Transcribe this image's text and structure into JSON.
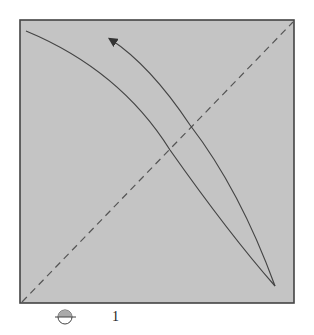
{
  "diagram": {
    "background": "#ffffff",
    "panel_fill": "#c4c4c4",
    "stroke_color": "#444444",
    "box": {
      "x1": 20,
      "y1": 20,
      "x2": 294,
      "y2": 303
    },
    "diagonal": {
      "style": "dashed",
      "from": [
        22,
        302
      ],
      "to": [
        293,
        22
      ]
    },
    "curves": [
      {
        "name": "lower-curve",
        "from": [
          26,
          31
        ],
        "to": [
          275,
          286
        ],
        "arrow": false
      },
      {
        "name": "upper-curve-with-arrow",
        "from": [
          275,
          286
        ],
        "to": [
          108,
          38
        ],
        "arrow": true
      }
    ]
  },
  "labels": {
    "tick_one": "1"
  },
  "icons": {
    "bottom_symbol": "half-filled-circle-icon"
  }
}
